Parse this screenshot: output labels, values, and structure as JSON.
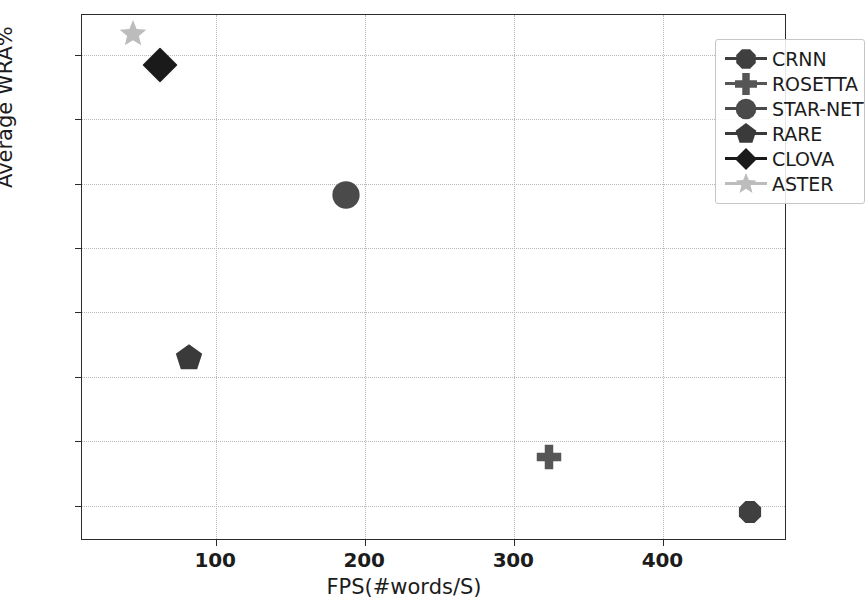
{
  "chart_data": {
    "type": "scatter",
    "title": "",
    "xlabel": "FPS(#words/S)",
    "ylabel": "Average WRA%",
    "xlim": [
      10,
      483
    ],
    "ylim": [
      67.45,
      75.62
    ],
    "xticks": [
      100,
      200,
      300,
      400
    ],
    "yticks": [
      68,
      69,
      70,
      71,
      72,
      73,
      74,
      75
    ],
    "grid": true,
    "legend_position": "upper right",
    "series": [
      {
        "name": "CRNN",
        "marker": "octagon",
        "color": "#3f3f3f",
        "x": 458,
        "y": 67.9
      },
      {
        "name": "ROSETTA",
        "marker": "plus",
        "color": "#565656",
        "x": 323,
        "y": 68.75
      },
      {
        "name": "STAR-NET",
        "marker": "circle",
        "color": "#4a4a4a",
        "x": 187,
        "y": 72.83
      },
      {
        "name": "RARE",
        "marker": "pentagon",
        "color": "#3a3a3a",
        "x": 82,
        "y": 70.3
      },
      {
        "name": "CLOVA",
        "marker": "diamond",
        "color": "#1a1a1a",
        "x": 62,
        "y": 74.85
      },
      {
        "name": "ASTER",
        "marker": "star",
        "color": "#bcbcbc",
        "x": 44,
        "y": 75.32
      }
    ]
  },
  "axes": {
    "xlabel": "FPS(#words/S)",
    "ylabel": "Average WRA%",
    "xticklabels": [
      "100",
      "200",
      "300",
      "400"
    ],
    "yticklabels": [
      "68",
      "69",
      "70",
      "71",
      "72",
      "73",
      "74",
      "75"
    ]
  },
  "legend": {
    "entries": [
      {
        "label": "CRNN"
      },
      {
        "label": "ROSETTA"
      },
      {
        "label": "STAR-NET"
      },
      {
        "label": "RARE"
      },
      {
        "label": "CLOVA"
      },
      {
        "label": "ASTER"
      }
    ]
  }
}
